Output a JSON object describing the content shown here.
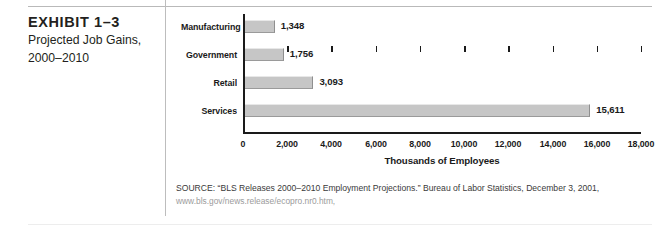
{
  "exhibit": {
    "title": "EXHIBIT 1–3",
    "subtitle_line1": "Projected Job Gains,",
    "subtitle_line2": "2000–2010"
  },
  "source": {
    "line1": "SOURCE: “BLS Releases 2000–2010 Employment Projections.” Bureau of Labor Statistics, December 3, 2001,",
    "url": "www.bls.gov/news.release/ecopro.nr0.htm,"
  },
  "colors": {
    "bar_fill": "#c6c6c6",
    "bar_highlight": "#e8e8e8",
    "bar_shadow": "#9a9a9a",
    "axis": "#1a1a1a",
    "text": "#231f20",
    "url_text": "#9b9b9b",
    "rule": "#b9b9b9"
  },
  "chart_data": {
    "type": "bar",
    "orientation": "horizontal",
    "title": "",
    "categories": [
      "Manufacturing",
      "Government",
      "Retail",
      "Services"
    ],
    "values": [
      1348,
      1756,
      3093,
      15611
    ],
    "value_labels": [
      "1,348",
      "1,756",
      "3,093",
      "15,611"
    ],
    "xlabel": "Thousands of Employees",
    "ylabel": "",
    "xlim": [
      0,
      18000
    ],
    "xticks": [
      0,
      2000,
      4000,
      6000,
      8000,
      10000,
      12000,
      14000,
      16000,
      18000
    ],
    "xtick_labels": [
      "0",
      "2,000",
      "4,000",
      "6,000",
      "8,000",
      "10,000",
      "12,000",
      "14,000",
      "16,000",
      "18,000"
    ],
    "grid": false,
    "legend": false
  }
}
